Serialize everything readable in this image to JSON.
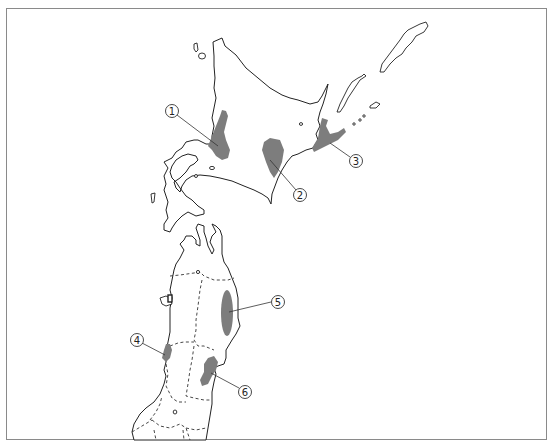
{
  "map": {
    "title": "",
    "regions_shown": [
      "Hokkaido",
      "Northern Tohoku"
    ],
    "shade_color": "#7d7d7d",
    "line_color": "#222222",
    "frame_color": "#8a8a8a",
    "labels": [
      {
        "id": 1,
        "text": "①",
        "x": 172,
        "y": 111,
        "target_x": 218,
        "target_y": 146
      },
      {
        "id": 2,
        "text": "②",
        "x": 300,
        "y": 195,
        "target_x": 270,
        "target_y": 160
      },
      {
        "id": 3,
        "text": "③",
        "x": 356,
        "y": 161,
        "target_x": 330,
        "target_y": 143
      },
      {
        "id": 4,
        "text": "④",
        "x": 137,
        "y": 340,
        "target_x": 165,
        "target_y": 355
      },
      {
        "id": 5,
        "text": "⑤",
        "x": 278,
        "y": 302,
        "target_x": 229,
        "target_y": 312
      },
      {
        "id": 6,
        "text": "⑥",
        "x": 245,
        "y": 392,
        "target_x": 211,
        "target_y": 373
      }
    ]
  }
}
